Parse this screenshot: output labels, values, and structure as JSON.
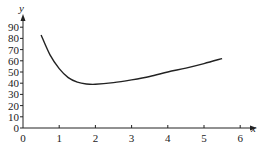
{
  "chart_data": {
    "type": "line",
    "title": "",
    "xlabel": "x",
    "ylabel": "y",
    "xlim": [
      0,
      6
    ],
    "ylim": [
      0,
      90
    ],
    "xticks": [
      0,
      1,
      2,
      3,
      4,
      5,
      6
    ],
    "yticks": [
      0,
      10,
      20,
      30,
      40,
      50,
      60,
      70,
      80,
      90
    ],
    "grid": false,
    "legend": null,
    "series": [
      {
        "name": "curve",
        "x": [
          0.5,
          0.75,
          1.0,
          1.25,
          1.5,
          1.75,
          2.0,
          2.5,
          3.0,
          3.5,
          4.0,
          4.5,
          5.0,
          5.5
        ],
        "y": [
          83,
          65,
          53,
          45,
          41,
          39.3,
          39,
          40.5,
          43,
          46,
          50,
          53.5,
          57.5,
          62
        ]
      }
    ]
  }
}
